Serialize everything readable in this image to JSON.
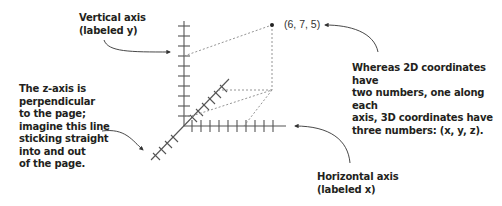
{
  "annotations": {
    "vertical_axis": "Vertical axis\n(labeled y)",
    "z_axis": "The z-axis is\nperpendicular\nto the page;\nimagine this line\nsticking straight\ninto and out\nof the page.",
    "coordinates_note": "Whereas 2D coordinates have\ntwo numbers, one along each\naxis, 3D coordinates have\nthree numbers: (x, y, z).",
    "horizontal_axis": "Horizontal axis\n(labeled x)"
  },
  "point": {
    "label": "(6, 7, 5)",
    "x": 6,
    "y": 7,
    "z": 5
  },
  "colors": {
    "axis": "#555555",
    "dashed": "#888888",
    "text": "#231f20",
    "arrow": "#333333"
  }
}
